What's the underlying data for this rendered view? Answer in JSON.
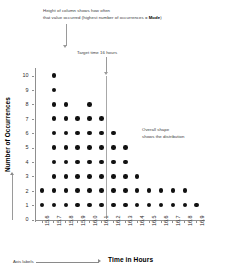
{
  "chart_data": {
    "type": "scatter",
    "plot_style": "dot-plot",
    "title": "",
    "xlabel": "Time in Hours",
    "ylabel": "Number of Occurrences",
    "categories": [
      "15.6",
      "15.7",
      "15.8",
      "15.9",
      "16.0",
      "16.1",
      "16.2",
      "16.3",
      "16.4",
      "16.5",
      "16.6",
      "16.7",
      "16.8",
      "16.9"
    ],
    "values": [
      2,
      10,
      8,
      7,
      8,
      7,
      6,
      5,
      3,
      2,
      2,
      2,
      2,
      1
    ],
    "y_ticks": [
      "0",
      "1",
      "2",
      "3",
      "4",
      "5",
      "6",
      "7",
      "8",
      "9",
      "10"
    ],
    "ylim": [
      0,
      10
    ],
    "grid": false,
    "legend": "none",
    "row_counts": {
      "1": 14,
      "2": 13,
      "3": 7,
      "4": 6,
      "5": 6,
      "6": 5,
      "7": 4,
      "8": 3,
      "9": 1,
      "10": 1
    },
    "mode_category": "15.7",
    "mode_value": 10,
    "target_line_category": "16.0",
    "dot_color": "#111111",
    "axis_color": "#8f8f8f",
    "annotation_color": "#3a3a3a"
  },
  "annotations": {
    "mode_note_line1": "Height of column shows how often",
    "mode_note_line2_pre": "that value occurred (highest number of occurrences = ",
    "mode_note_bold": "Mode",
    "mode_note_line2_post": ")",
    "target_note": "Target time 16 hours",
    "shape_note_line1": "Overall shape",
    "shape_note_line2": "shows the distribution",
    "axis_labels_note": "Axis labels"
  }
}
